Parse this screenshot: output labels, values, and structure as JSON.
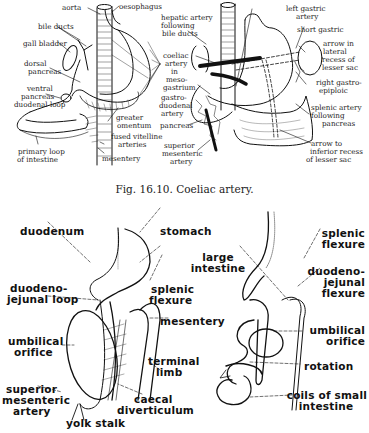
{
  "figure_top": {
    "caption": "Fig. 16.10. Coeliac artery.",
    "left_panel_labels": {
      "aorta": "aorta",
      "oesophagus": "oesophagus",
      "bile_ducts": "bile ducts",
      "gall_bladder": "gall bladder",
      "dorsal_pancreas": [
        "dorsal",
        "pancreas"
      ],
      "stomach": "stomach",
      "ventral_pancreas": [
        "ventral",
        "pancreas"
      ],
      "duodenal_loop": "duodenal loop",
      "greater_omentum": [
        "greater",
        "omentum"
      ],
      "fused_vitelline_arteries": [
        "fused vitelline",
        "arteries"
      ],
      "primary_loop": [
        "primary loop",
        "of intestine"
      ],
      "mesentery": "mesentery"
    },
    "right_panel_labels": {
      "hepatic_artery": [
        "hepatic artery",
        "following",
        "bile ducts"
      ],
      "coeliac_artery": [
        "coeliac",
        "artery",
        "in",
        "meso-",
        "gastrium"
      ],
      "gastroduodenal_artery": [
        "gastro-",
        "duodenal",
        "artery"
      ],
      "pancreas": "pancreas",
      "superior_mesenteric_artery": [
        "superior",
        "mesenteric",
        "artery"
      ],
      "left_gastric_artery": [
        "left gastric",
        "artery"
      ],
      "short_gastric": "short gastric",
      "arrow_lateral_recess": [
        "arrow in",
        "lateral",
        "recess of",
        "lesser sac"
      ],
      "right_gastroepiploic": [
        "right gastro-",
        "epiploic"
      ],
      "splenic_artery": [
        "splenic artery",
        "following",
        "pancreas"
      ],
      "arrow_inferior_recess": [
        "arrow to",
        "inferior recess",
        "of lesser sac"
      ]
    }
  },
  "figure_bottom": {
    "left_panel_labels": {
      "duodenum": "duodenum",
      "stomach": "stomach",
      "duodenojejunal_loop": [
        "duodeno-",
        "jejunal loop"
      ],
      "splenic_flexure": [
        "splenic",
        "flexure"
      ],
      "mesentery": "mesentery",
      "umbilical_orifice": [
        "umbilical",
        "orifice"
      ],
      "terminal_limb": [
        "terminal",
        "limb"
      ],
      "superior_mesenteric_artery": [
        "superior",
        "mesenteric",
        "artery"
      ],
      "caecal_diverticulum": [
        "caecal",
        "diverticulum"
      ],
      "yolk_stalk": "yolk stalk"
    },
    "right_panel_labels": {
      "large_intestine": [
        "large",
        "intestine"
      ],
      "splenic_flexure": [
        "splenic",
        "flexure"
      ],
      "duodenojejunal_flexure": [
        "duodeno-",
        "jejunal",
        "flexure"
      ],
      "umbilical_orifice": [
        "umbilical",
        "orifice"
      ],
      "rotation": "rotation",
      "coils_small_intestine": [
        "coils of small",
        "intestine"
      ]
    }
  }
}
